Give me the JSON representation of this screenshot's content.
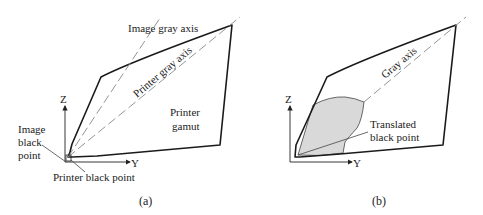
{
  "panels": [
    {
      "id": "a",
      "caption": "(a)",
      "axes": {
        "z": "Z",
        "y": "Y"
      },
      "labels": {
        "image_gray_axis": "Image gray axis",
        "printer_gray_axis": "Printer gray axis",
        "printer_gamut_line1": "Printer",
        "printer_gamut_line2": "gamut",
        "image_black_point_line1": "Image",
        "image_black_point_line2": "black",
        "image_black_point_line3": "point",
        "printer_black_point": "Printer black point"
      }
    },
    {
      "id": "b",
      "caption": "(b)",
      "axes": {
        "z": "Z",
        "y": "Y"
      },
      "labels": {
        "gray_axis": "Gray axis",
        "translated_black_point_line1": "Translated",
        "translated_black_point_line2": "black point"
      }
    }
  ],
  "colors": {
    "outline": "#1a1a1a",
    "dashed_axis": "#888888",
    "shaded_region": "#d9d9d9"
  }
}
